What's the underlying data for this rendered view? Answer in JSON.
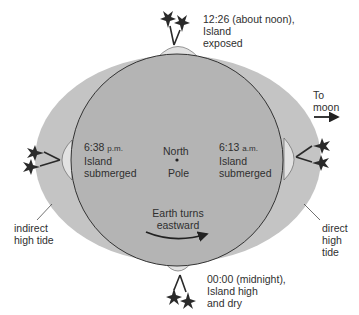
{
  "diagram": {
    "colors": {
      "tidal_bulge": "#c4c4c4",
      "earth": "#b4b4b4",
      "island": "#e2e2e2",
      "outline": "#333333",
      "text": "#2f2f2f"
    },
    "labels": {
      "top": {
        "time": "12:26 (about noon),",
        "line2": "Island",
        "line3": "exposed"
      },
      "left": {
        "time": "6:38",
        "period": "p.m.",
        "line2": "Island",
        "line3": "submerged"
      },
      "right": {
        "time": "6:13",
        "period": "a.m.",
        "line2": "Island",
        "line3": "submerged"
      },
      "bottom": {
        "time": "00:00 (midnight),",
        "line2": "Island high",
        "line3": "and dry"
      },
      "center": {
        "line1": "North",
        "line2": "Pole"
      },
      "rotation": {
        "line1": "Earth turns",
        "line2": "eastward"
      },
      "moon": {
        "line1": "To",
        "line2": "moon"
      },
      "indirect": {
        "line1": "indirect",
        "line2": "high tide"
      },
      "direct": {
        "line1": "direct",
        "line2": "high",
        "line3": "tide"
      }
    }
  }
}
